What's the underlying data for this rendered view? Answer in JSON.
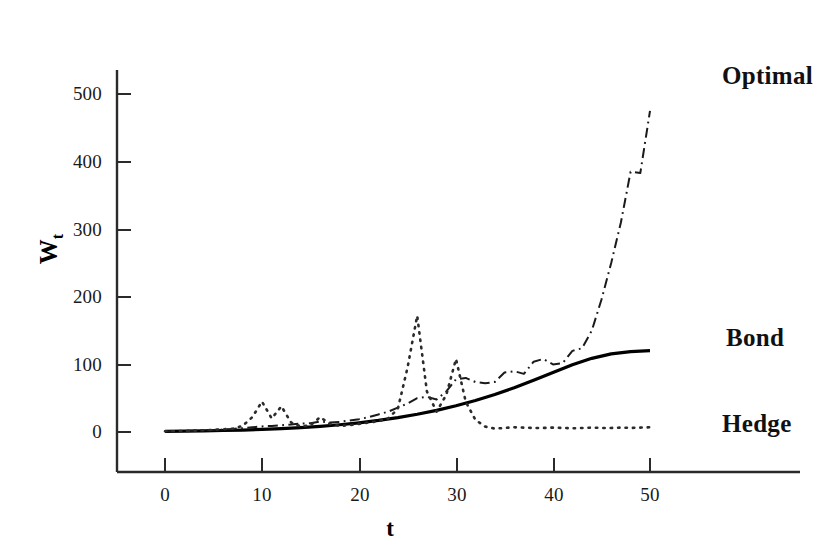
{
  "chart_data": {
    "type": "line",
    "title": "",
    "subtitle": "",
    "xlabel": "t",
    "ylabel": "W_t",
    "ylabel_base": "W",
    "ylabel_sub": "t",
    "xlim": [
      -5,
      55
    ],
    "ylim": [
      -40,
      540
    ],
    "xticks": [
      0,
      10,
      20,
      30,
      40,
      50
    ],
    "xtick_labels": [
      "0",
      "10",
      "20",
      "30",
      "40",
      "50"
    ],
    "yticks": [
      0,
      100,
      200,
      300,
      400,
      500
    ],
    "ytick_labels": [
      "0",
      "100",
      "200",
      "300",
      "400",
      "500"
    ],
    "grid": false,
    "legend": "inline-annotations-right",
    "annotations": [
      {
        "text": "Optimal",
        "x": 50,
        "y": 475,
        "series": "Optimal"
      },
      {
        "text": "Bond",
        "x": 50,
        "y": 120,
        "series": "Bond"
      },
      {
        "text": "Hedge",
        "x": 50,
        "y": 6,
        "series": "Hedge"
      }
    ],
    "series": [
      {
        "name": "Bond",
        "style": "solid",
        "color": "#000000",
        "width": 3.2,
        "x": [
          0,
          2,
          4,
          6,
          8,
          10,
          12,
          14,
          16,
          18,
          20,
          22,
          24,
          26,
          28,
          30,
          32,
          34,
          36,
          38,
          40,
          42,
          44,
          46,
          48,
          50
        ],
        "values": [
          1,
          1.3,
          1.7,
          2.2,
          2.9,
          3.8,
          4.9,
          6.4,
          8.3,
          10.7,
          13.6,
          17.1,
          21.3,
          26.2,
          32.0,
          38.8,
          46.6,
          55.5,
          65.5,
          76.5,
          88.0,
          99.5,
          109.0,
          115.5,
          119.0,
          120.5
        ]
      },
      {
        "name": "Optimal",
        "style": "dashdot",
        "color": "#1a1a1a",
        "width": 2.0,
        "x": [
          0,
          1,
          2,
          3,
          4,
          5,
          6,
          7,
          8,
          9,
          10,
          11,
          12,
          13,
          14,
          15,
          16,
          17,
          18,
          19,
          20,
          21,
          22,
          23,
          24,
          25,
          26,
          27,
          28,
          29,
          30,
          31,
          32,
          33,
          34,
          35,
          36,
          37,
          38,
          39,
          40,
          41,
          42,
          43,
          44,
          45,
          46,
          47,
          48,
          49,
          50
        ],
        "values": [
          1,
          1.2,
          1.5,
          1.9,
          2.4,
          3.0,
          3.7,
          4.6,
          5.6,
          6.9,
          8.3,
          9.0,
          10.0,
          11.0,
          12.5,
          13.0,
          15.5,
          14.0,
          15.0,
          17.0,
          19.0,
          22.0,
          26.0,
          30.0,
          36.0,
          42.0,
          50.0,
          52.0,
          48.0,
          60.0,
          78.0,
          80.0,
          74.0,
          72.0,
          74.0,
          88.0,
          90.0,
          86.0,
          104.0,
          108.0,
          100.0,
          102.0,
          120.0,
          124.0,
          150.0,
          196.0,
          250.0,
          310.0,
          385.0,
          383.0,
          475.0
        ]
      },
      {
        "name": "Hedge",
        "style": "dotted",
        "color": "#2b2b2b",
        "width": 2.6,
        "x": [
          0,
          1,
          2,
          3,
          4,
          5,
          6,
          7,
          8,
          9,
          10,
          11,
          12,
          13,
          14,
          15,
          16,
          17,
          18,
          19,
          20,
          21,
          22,
          23,
          24,
          25,
          26,
          27,
          28,
          29,
          30,
          31,
          32,
          33,
          34,
          35,
          36,
          37,
          38,
          39,
          40,
          41,
          42,
          43,
          44,
          45,
          46,
          47,
          48,
          49,
          50
        ],
        "values": [
          1,
          1.2,
          1.5,
          2.0,
          2.6,
          3.2,
          4.0,
          5.0,
          9.0,
          22.0,
          45.0,
          20.0,
          38.0,
          14.0,
          8.0,
          10.0,
          22.0,
          12.0,
          9.0,
          10.0,
          12.0,
          14.0,
          16.0,
          20.0,
          34.0,
          95.0,
          172.0,
          60.0,
          30.0,
          55.0,
          108.0,
          45.0,
          18.0,
          8.0,
          5.0,
          6.0,
          7.0,
          6.5,
          6.0,
          6.0,
          6.5,
          6.0,
          5.5,
          6.0,
          6.5,
          6.0,
          6.0,
          6.5,
          6.0,
          6.5,
          7.0
        ]
      }
    ]
  },
  "axes": {
    "y_axis_name": "vertical-axis",
    "x_axis_name": "horizontal-axis"
  }
}
